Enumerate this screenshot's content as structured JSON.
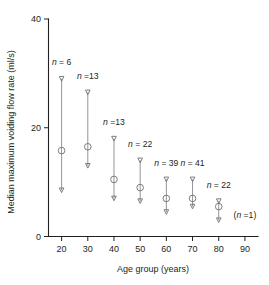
{
  "chart_data": {
    "type": "scatter",
    "title": "",
    "xlabel": "Age group (years)",
    "ylabel": "Median maximum voiding flow rate (ml/s)",
    "xlim": [
      15,
      95
    ],
    "ylim": [
      0,
      40
    ],
    "x_ticks": [
      20,
      30,
      40,
      50,
      60,
      70,
      80,
      90
    ],
    "y_ticks": [
      0,
      20,
      40
    ],
    "grid": false,
    "legend": null,
    "categories": [
      "20",
      "30",
      "40",
      "50",
      "60",
      "70",
      "80",
      "90"
    ],
    "values": [
      15.8,
      16.5,
      10.5,
      9.0,
      7.0,
      7.0,
      5.5,
      null
    ],
    "series": [
      {
        "name": "Median",
        "values": [
          15.8,
          16.5,
          10.5,
          9.0,
          7.0,
          7.0,
          5.5,
          null
        ]
      },
      {
        "name": "Upper range",
        "values": [
          29.0,
          26.5,
          18.0,
          14.0,
          10.5,
          10.5,
          6.5,
          null
        ]
      },
      {
        "name": "Lower range",
        "values": [
          8.5,
          13.0,
          7.0,
          6.5,
          4.5,
          5.5,
          3.0,
          null
        ]
      }
    ],
    "points": [
      {
        "age": 20,
        "median": 15.8,
        "upper": 29.0,
        "lower": 8.5,
        "n": 6,
        "n_label": "n = 6",
        "n_label_x": 20,
        "n_label_y": 31.5
      },
      {
        "age": 30,
        "median": 16.5,
        "upper": 26.5,
        "lower": 13.0,
        "n": 13,
        "n_label": "n =13",
        "n_label_x": 30,
        "n_label_y": 29.0
      },
      {
        "age": 40,
        "median": 10.5,
        "upper": 18.0,
        "lower": 7.0,
        "n": 13,
        "n_label": "n =13",
        "n_label_x": 40,
        "n_label_y": 20.5
      },
      {
        "age": 50,
        "median": 9.0,
        "upper": 14.0,
        "lower": 6.5,
        "n": 22,
        "n_label": "n = 22",
        "n_label_x": 50,
        "n_label_y": 16.5
      },
      {
        "age": 60,
        "median": 7.0,
        "upper": 10.5,
        "lower": 4.5,
        "n": 39,
        "n_label": "n = 39",
        "n_label_x": 60,
        "n_label_y": 13.0
      },
      {
        "age": 70,
        "median": 7.0,
        "upper": 10.5,
        "lower": 5.5,
        "n": 41,
        "n_label": "n = 41",
        "n_label_x": 70,
        "n_label_y": 13.0
      },
      {
        "age": 80,
        "median": 5.5,
        "upper": 6.5,
        "lower": 3.0,
        "n": 22,
        "n_label": "n = 22",
        "n_label_x": 80,
        "n_label_y": 9.0
      },
      {
        "age": 90,
        "median": null,
        "upper": null,
        "lower": null,
        "n": 1,
        "n_label": "(n =1)",
        "n_label_x": 90,
        "n_label_y": 3.4
      }
    ],
    "marker_shapes": {
      "median": "open-circle",
      "upper_cap": "open-down-triangle",
      "lower_cap": "open-down-triangle"
    },
    "colors": {
      "axis": "#231f20",
      "marker_stroke": "#6f6f71",
      "stem": "#8a8a8c",
      "text": "#231f20",
      "background": "#ffffff"
    }
  },
  "axes": {
    "y_title": "Median maximum voiding flow rate (ml/s)",
    "x_title": "Age group (years)",
    "y_tick_labels": [
      "0",
      "20",
      "40"
    ],
    "x_tick_labels": [
      "20",
      "30",
      "40",
      "50",
      "60",
      "70",
      "80",
      "90"
    ]
  }
}
